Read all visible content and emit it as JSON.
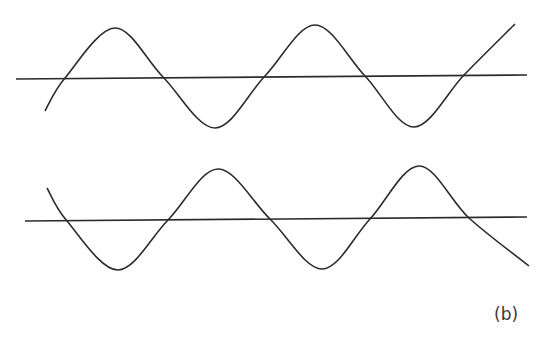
{
  "figure": {
    "label": "(b)",
    "stroke_color": "#2b2b2b",
    "panels": [
      {
        "name": "top-wave",
        "axis": {
          "x1": 16,
          "y1": 79,
          "x2": 527,
          "y2": 75
        },
        "wave_points": [
          [
            45,
            111
          ],
          [
            65,
            78
          ],
          [
            115,
            28
          ],
          [
            163,
            77
          ],
          [
            215,
            128
          ],
          [
            265,
            76
          ],
          [
            315,
            25
          ],
          [
            365,
            76
          ],
          [
            414,
            127
          ],
          [
            464,
            75
          ],
          [
            515,
            24
          ]
        ],
        "phase": "starts below axis rising"
      },
      {
        "name": "bottom-wave",
        "axis": {
          "x1": 25,
          "y1": 221,
          "x2": 527,
          "y2": 217
        },
        "wave_points": [
          [
            47,
            188
          ],
          [
            67,
            221
          ],
          [
            118,
            270
          ],
          [
            168,
            220
          ],
          [
            218,
            169
          ],
          [
            270,
            219
          ],
          [
            322,
            269
          ],
          [
            370,
            219
          ],
          [
            419,
            166
          ],
          [
            469,
            218
          ],
          [
            529,
            266
          ]
        ],
        "phase": "starts above axis falling (inverted)"
      }
    ]
  }
}
